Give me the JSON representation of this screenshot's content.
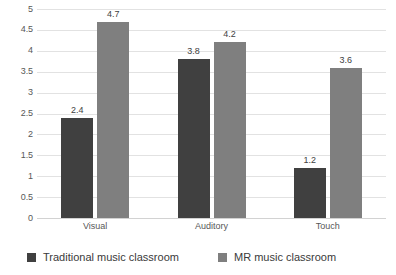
{
  "chart_data": {
    "type": "bar",
    "title": "",
    "xlabel": "",
    "ylabel": "",
    "ylim": [
      0,
      5
    ],
    "ytick_step": 0.5,
    "grid": true,
    "legend_position": "bottom",
    "categories": [
      "Visual",
      "Auditory",
      "Touch"
    ],
    "ytick_labels": [
      "5",
      "4.5",
      "4",
      "3.5",
      "3",
      "2.5",
      "2",
      "1.5",
      "1",
      "0.5",
      "0"
    ],
    "ytick_values": [
      5,
      4.5,
      4,
      3.5,
      3,
      2.5,
      2,
      1.5,
      1,
      0.5,
      0
    ],
    "series": [
      {
        "name": "Traditional music classroom",
        "color": "#404040",
        "values": [
          2.4,
          3.8,
          1.2
        ],
        "labels": [
          "2.4",
          "3.8",
          "1.2"
        ]
      },
      {
        "name": "MR music classroom",
        "color": "#7f7f7f",
        "values": [
          4.7,
          4.2,
          3.6
        ],
        "labels": [
          "4.7",
          "4.2",
          "3.6"
        ]
      }
    ]
  },
  "legend": {
    "items": [
      {
        "label": "Traditional music classroom",
        "color": "#404040"
      },
      {
        "label": "MR music classroom",
        "color": "#7f7f7f"
      }
    ]
  }
}
